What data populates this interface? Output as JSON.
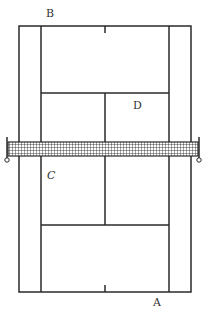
{
  "diagram": {
    "type": "tennis-court",
    "line_color": "#2a2a2a",
    "background": "#ffffff",
    "labels": {
      "A": "A",
      "B": "B",
      "C": "C",
      "D": "D"
    },
    "positions": {
      "A": {
        "x": 153,
        "y": 297
      },
      "B": {
        "x": 46,
        "y": 8
      },
      "C": {
        "x": 47,
        "y": 170
      },
      "D": {
        "x": 133,
        "y": 101
      }
    }
  }
}
